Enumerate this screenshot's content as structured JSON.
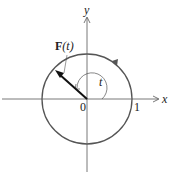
{
  "diagram": {
    "axis_x_label": "x",
    "axis_y_label": "y",
    "origin_label": "0",
    "unit_label": "1",
    "vector_label_bold": "F",
    "vector_label_arg": "(t)",
    "angle_label": "t",
    "colors": {
      "axis": "#444444",
      "circle": "#555555",
      "vector": "#111111",
      "text": "#222222"
    }
  }
}
